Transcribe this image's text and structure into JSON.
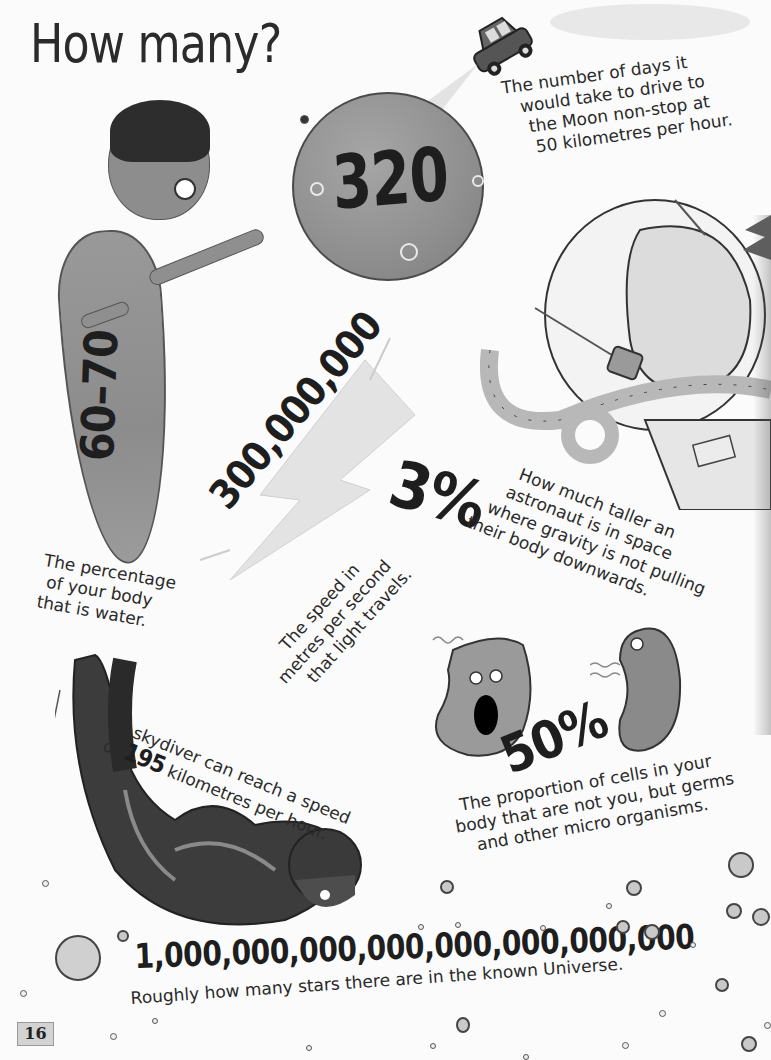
{
  "page": {
    "title": "How many?",
    "page_number": "16"
  },
  "facts": {
    "moon_drive": {
      "number": "320",
      "caption_lines": [
        "The number of days it",
        "would take to drive to",
        "the Moon non-stop at",
        "50 kilometres per hour."
      ]
    },
    "body_water": {
      "number": "60–70",
      "caption_lines": [
        "The percentage",
        "of your body",
        "that is water."
      ]
    },
    "light_speed": {
      "number": "300,000,000",
      "caption_lines": [
        "The speed in",
        "metres per second",
        "that light travels."
      ]
    },
    "astronaut": {
      "number": "3%",
      "caption_lines": [
        "How much taller an",
        "astronaut is in space",
        "where gravity is not pulling",
        "their body downwards."
      ]
    },
    "skydiver": {
      "line1": "A skydiver can reach a speed",
      "line2_prefix": "of",
      "number": "195",
      "line2_suffix": "kilometres per hour."
    },
    "germs": {
      "number": "50%",
      "caption_lines": [
        "The proportion of cells in your",
        "body that are not you, but germs",
        "and other micro organisms."
      ]
    },
    "stars": {
      "number": "1,000,000,000,000,000,000,000,000",
      "caption": "Roughly how many stars there are in the known Universe."
    }
  },
  "illustrations": {
    "moon": "moon-illustration",
    "car": "car-illustration",
    "person": "person-illustration",
    "lightning": "lightning-bolt-illustration",
    "astronaut_helmet": "astronaut-helmet-illustration",
    "germs": "germ-illustrations",
    "skydiver": "skydiver-illustration",
    "bubbles": "star-bubbles"
  },
  "colors": {
    "ink": "#262626",
    "illustration_gray": "#8f8f8f",
    "page_bg": "#fbfbfb",
    "page_tab": "#d3d3d3"
  }
}
